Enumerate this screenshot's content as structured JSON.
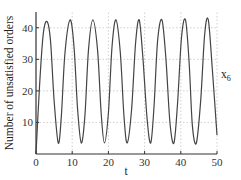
{
  "chart_data": {
    "type": "line",
    "title": "",
    "xlabel": "t",
    "ylabel": "Number of unsatisfied orders",
    "series_label": "x",
    "series_label_sub": "6",
    "xlim": [
      0,
      50
    ],
    "ylim": [
      0,
      45
    ],
    "xticks": [
      0,
      10,
      20,
      30,
      40,
      50
    ],
    "yticks": [
      10,
      20,
      30,
      40
    ],
    "xtick_labels": [
      "0",
      "10",
      "20",
      "30",
      "40",
      "50"
    ],
    "ytick_labels": [
      "10",
      "20",
      "30",
      "40"
    ],
    "grid": true,
    "legend": "none",
    "series": [
      {
        "name": "x6",
        "color": "#444444",
        "x": [
          0,
          1,
          2,
          3.05,
          4,
          5,
          6.15,
          7,
          8,
          9.4,
          10.5,
          11.5,
          12.5,
          13.5,
          14.5,
          15.7,
          17,
          18,
          18.9,
          20,
          21,
          22.1,
          23.3,
          24.3,
          25.2,
          26.4,
          27.5,
          28.5,
          29.5,
          30.7,
          31.7,
          32.6,
          33.6,
          34.8,
          35.9,
          37.0,
          38.1,
          39.1,
          40.2,
          41.3,
          42.3,
          43.2,
          44.3,
          45.5,
          46.6,
          47.6,
          48.7,
          50
        ],
        "values": [
          0,
          22,
          38,
          42,
          36,
          17,
          3.5,
          12,
          32,
          42.5,
          34,
          14,
          3.5,
          12,
          33,
          42.5,
          33,
          13,
          3.5,
          13,
          34,
          42.5,
          32,
          12,
          3.5,
          14,
          35,
          42.5,
          31,
          11,
          3.5,
          15,
          36,
          42.5,
          30,
          10,
          3.5,
          16,
          37,
          42.5,
          29,
          9,
          3.5,
          17,
          38,
          42.5,
          27,
          6
        ]
      }
    ]
  }
}
